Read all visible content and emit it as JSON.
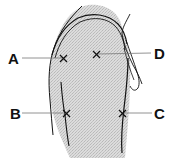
{
  "diagram": {
    "colors": {
      "ink": "#111111",
      "shade": "#d2d2d2",
      "leader": "#777777"
    },
    "sites": [
      {
        "id": "A",
        "label": "A",
        "marker": "x-mark"
      },
      {
        "id": "B",
        "label": "B",
        "marker": "x-mark"
      },
      {
        "id": "C",
        "label": "C",
        "marker": "x-mark"
      },
      {
        "id": "D",
        "label": "D",
        "marker": "x-mark"
      }
    ]
  }
}
